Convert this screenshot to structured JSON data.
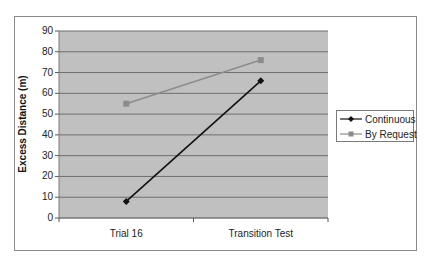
{
  "chart_data": {
    "type": "line",
    "title": "",
    "xlabel": "",
    "ylabel": "Excess Distance (m)",
    "categories": [
      "Trial 16",
      "Transition Test"
    ],
    "series": [
      {
        "name": "Continuous",
        "values": [
          8,
          66
        ],
        "color": "#111111",
        "marker": "diamond"
      },
      {
        "name": "By Request",
        "values": [
          55,
          76
        ],
        "color": "#8c8c8c",
        "marker": "square"
      }
    ],
    "ylim": [
      0,
      90
    ],
    "yticks": [
      "0",
      "10",
      "20",
      "30",
      "40",
      "50",
      "60",
      "70",
      "80",
      "90"
    ],
    "grid": true,
    "legend_position": "right",
    "plot_background": "#c0c0c0"
  }
}
